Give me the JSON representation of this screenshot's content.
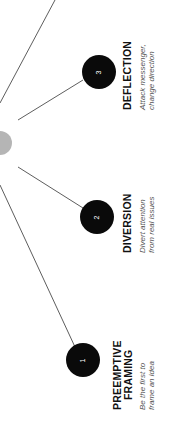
{
  "diagram": {
    "colors": {
      "node": "#0a0a0a",
      "hub": "#b5b5b5",
      "line": "#333333",
      "title": "#111111",
      "desc": "#555555"
    },
    "items": [
      {
        "number": "1",
        "title_lines": [
          "PREEMPTIVE",
          "FRAMING"
        ],
        "desc_lines": [
          "Be the first to",
          "frame an idea"
        ]
      },
      {
        "number": "2",
        "title_lines": [
          "DIVERSION"
        ],
        "desc_lines": [
          "Divert attention",
          "from real issues"
        ]
      },
      {
        "number": "3",
        "title_lines": [
          "DEFLECTION"
        ],
        "desc_lines": [
          "Attack messenger,",
          "change direction"
        ]
      }
    ]
  }
}
